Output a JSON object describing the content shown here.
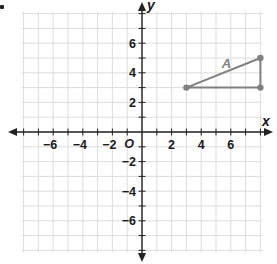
{
  "diagram": {
    "type": "coordinate-plane",
    "origin_label": "O",
    "x_axis_label": "x",
    "y_axis_label": "y",
    "range": {
      "xmin": -8,
      "xmax": 8,
      "ymin": -8,
      "ymax": 8
    },
    "x_tick_labels": [
      "-6",
      "-4",
      "-2",
      "2",
      "4",
      "6"
    ],
    "y_tick_labels": [
      "6",
      "4",
      "2",
      "-2",
      "-4",
      "-6"
    ],
    "colors": {
      "grid": "#d9d9d9",
      "axis": "#222222",
      "shape": "#808080",
      "label": "#1a1a1a"
    }
  },
  "shape": {
    "label": "A",
    "vertices": [
      {
        "x": 3,
        "y": 3
      },
      {
        "x": 8,
        "y": 5
      },
      {
        "x": 8,
        "y": 3
      }
    ]
  },
  "chart_data": {
    "type": "scatter",
    "title": "",
    "xlabel": "x",
    "ylabel": "y",
    "xlim": [
      -8,
      8
    ],
    "ylim": [
      -8,
      8
    ],
    "grid": true,
    "series": [
      {
        "name": "A",
        "points": [
          [
            3,
            3
          ],
          [
            8,
            5
          ],
          [
            8,
            3
          ]
        ],
        "closed_polygon": true
      }
    ]
  }
}
